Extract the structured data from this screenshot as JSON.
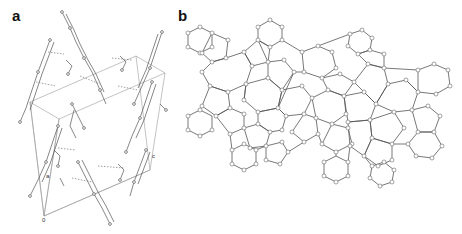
{
  "figure": {
    "panels": [
      {
        "id": "a",
        "label": "a",
        "description": "Crystal packing view with unit cell outline and hydrogen-bonded molecular chains",
        "axis_labels": {
          "origin": "0",
          "a": "a",
          "c": "c"
        }
      },
      {
        "id": "b",
        "label": "b",
        "description": "Ring network topology composed of fused hexagons and pentagons"
      }
    ],
    "colors": {
      "background": "#ffffff",
      "line": "#555555",
      "atom_fill": "#ffffff",
      "atom_stroke": "#666666",
      "label": "#111111"
    }
  }
}
